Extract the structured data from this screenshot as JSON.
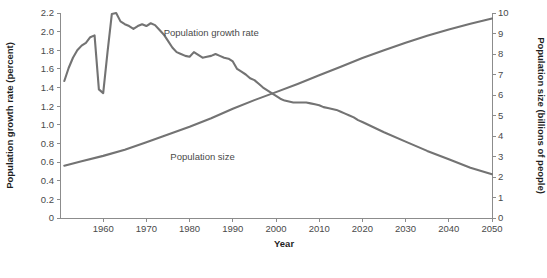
{
  "chart_data": {
    "type": "line",
    "title": "",
    "xlabel": "Year",
    "ylabel": "Population growth rate (percent)",
    "y2label": "Population size (billions of people)",
    "xlim": [
      1950,
      2050
    ],
    "ylim": [
      0,
      2.2
    ],
    "y2lim": [
      0,
      10
    ],
    "grid": false,
    "legend_position": "inline-annotations",
    "x_ticks": [
      "1960",
      "1970",
      "1980",
      "1990",
      "2000",
      "2010",
      "2020",
      "2030",
      "2040",
      "2050"
    ],
    "x_tick_values": [
      1960,
      1970,
      1980,
      1990,
      2000,
      2010,
      2020,
      2030,
      2040,
      2050
    ],
    "y_ticks_left": [
      "0",
      "0.2",
      "0.4",
      "0.6",
      "0.8",
      "1.0",
      "1.2",
      "1.4",
      "1.6",
      "1.8",
      "2.0",
      "2.2"
    ],
    "y_tick_values_left": [
      0,
      0.2,
      0.4,
      0.6,
      0.8,
      1.0,
      1.2,
      1.4,
      1.6,
      1.8,
      2.0,
      2.2
    ],
    "y_ticks_right": [
      "0",
      "1",
      "2",
      "3",
      "4",
      "5",
      "6",
      "7",
      "8",
      "9",
      "10"
    ],
    "y_tick_values_right": [
      0,
      1,
      2,
      3,
      4,
      5,
      6,
      7,
      8,
      9,
      10
    ],
    "line_color": "#737373",
    "axis_color": "#8c8c8c",
    "annotations": [
      {
        "text": "Population growth rate",
        "x": 1985,
        "y_axis": "left",
        "y": 1.95
      },
      {
        "text": "Population size",
        "x": 1983,
        "y_axis": "left",
        "y": 0.62
      }
    ],
    "series": [
      {
        "name": "Population growth rate",
        "axis": "left",
        "unit": "percent",
        "x": [
          1951,
          1952,
          1953,
          1954,
          1955,
          1956,
          1957,
          1958,
          1959,
          1960,
          1961,
          1962,
          1963,
          1964,
          1965,
          1966,
          1967,
          1968,
          1969,
          1970,
          1971,
          1972,
          1973,
          1974,
          1975,
          1976,
          1977,
          1978,
          1979,
          1980,
          1981,
          1982,
          1983,
          1984,
          1985,
          1986,
          1987,
          1988,
          1989,
          1990,
          1991,
          1992,
          1993,
          1994,
          1995,
          1996,
          1997,
          1998,
          1999,
          2000,
          2001,
          2002,
          2003,
          2004,
          2005,
          2006,
          2007,
          2008,
          2009,
          2010,
          2011,
          2012,
          2013,
          2014,
          2015,
          2016,
          2017,
          2018,
          2019,
          2020,
          2025,
          2030,
          2035,
          2040,
          2045,
          2050
        ],
        "values": [
          1.47,
          1.61,
          1.72,
          1.8,
          1.85,
          1.88,
          1.94,
          1.96,
          1.38,
          1.34,
          1.78,
          2.19,
          2.2,
          2.11,
          2.08,
          2.06,
          2.03,
          2.06,
          2.08,
          2.06,
          2.09,
          2.07,
          2.02,
          1.97,
          1.9,
          1.83,
          1.78,
          1.76,
          1.74,
          1.73,
          1.78,
          1.75,
          1.72,
          1.73,
          1.74,
          1.76,
          1.74,
          1.72,
          1.71,
          1.68,
          1.6,
          1.57,
          1.54,
          1.5,
          1.48,
          1.44,
          1.4,
          1.37,
          1.34,
          1.31,
          1.28,
          1.26,
          1.25,
          1.24,
          1.24,
          1.24,
          1.24,
          1.23,
          1.22,
          1.21,
          1.19,
          1.18,
          1.17,
          1.16,
          1.14,
          1.12,
          1.1,
          1.08,
          1.05,
          1.03,
          0.92,
          0.82,
          0.72,
          0.63,
          0.54,
          0.47
        ]
      },
      {
        "name": "Population size",
        "axis": "right",
        "unit": "billions of people",
        "x": [
          1951,
          1955,
          1960,
          1965,
          1970,
          1975,
          1980,
          1985,
          1990,
          1995,
          2000,
          2005,
          2010,
          2015,
          2020,
          2025,
          2030,
          2035,
          2040,
          2045,
          2050
        ],
        "values": [
          2.55,
          2.77,
          3.03,
          3.33,
          3.7,
          4.07,
          4.45,
          4.87,
          5.33,
          5.75,
          6.14,
          6.54,
          6.96,
          7.38,
          7.8,
          8.18,
          8.55,
          8.89,
          9.2,
          9.48,
          9.73
        ]
      }
    ]
  }
}
